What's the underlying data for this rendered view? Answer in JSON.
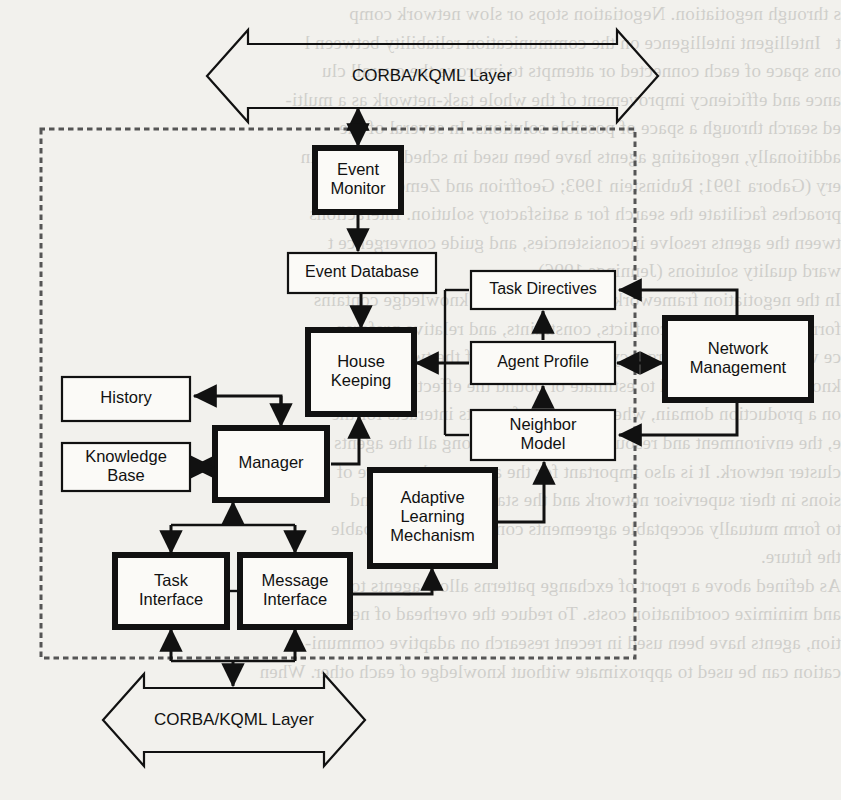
{
  "figure": {
    "background_color": "#f2f1ed",
    "line_color": "#111111",
    "box_fill": "#fbfaf7",
    "boundary_style": "dotted"
  },
  "layers": {
    "top": {
      "label": "CORBA/KQML Layer",
      "name": "top-corba-kqml-layer"
    },
    "bottom": {
      "label": "CORBA/KQML Layer",
      "name": "bottom-corba-kqml-layer"
    }
  },
  "nodes": [
    {
      "id": "event-monitor",
      "label_lines": [
        "Event",
        "Monitor"
      ],
      "emphasis": "thick",
      "x": 315,
      "y": 148,
      "w": 86,
      "h": 64
    },
    {
      "id": "event-database",
      "label_lines": [
        "Event Database"
      ],
      "emphasis": "thin",
      "x": 288,
      "y": 253,
      "w": 148,
      "h": 40
    },
    {
      "id": "house-keeping",
      "label_lines": [
        "House",
        "Keeping"
      ],
      "emphasis": "thick",
      "x": 308,
      "y": 330,
      "w": 106,
      "h": 84
    },
    {
      "id": "history",
      "label_lines": [
        "History"
      ],
      "emphasis": "thin",
      "x": 62,
      "y": 377,
      "w": 128,
      "h": 44
    },
    {
      "id": "knowledge-base",
      "label_lines": [
        "Knowledge",
        "Base"
      ],
      "emphasis": "thin",
      "x": 62,
      "y": 443,
      "w": 128,
      "h": 48
    },
    {
      "id": "manager",
      "label_lines": [
        "Manager"
      ],
      "emphasis": "thick",
      "x": 215,
      "y": 428,
      "w": 112,
      "h": 72
    },
    {
      "id": "task-interface",
      "label_lines": [
        "Task",
        "Interface"
      ],
      "emphasis": "thick",
      "x": 115,
      "y": 555,
      "w": 112,
      "h": 72
    },
    {
      "id": "message-interface",
      "label_lines": [
        "Message",
        "Interface"
      ],
      "emphasis": "thick",
      "x": 240,
      "y": 555,
      "w": 110,
      "h": 72
    },
    {
      "id": "adaptive-learning",
      "label_lines": [
        "Adaptive",
        "Learning",
        "Mechanism"
      ],
      "emphasis": "thick",
      "x": 370,
      "y": 470,
      "w": 125,
      "h": 96
    },
    {
      "id": "task-directives",
      "label_lines": [
        "Task Directives"
      ],
      "emphasis": "thin",
      "x": 471,
      "y": 271,
      "w": 144,
      "h": 38
    },
    {
      "id": "agent-profile",
      "label_lines": [
        "Agent Profile"
      ],
      "emphasis": "thin",
      "x": 471,
      "y": 342,
      "w": 144,
      "h": 42
    },
    {
      "id": "neighbor-model",
      "label_lines": [
        "Neighbor",
        "Model"
      ],
      "emphasis": "thin",
      "x": 471,
      "y": 410,
      "w": 144,
      "h": 50
    },
    {
      "id": "network-management",
      "label_lines": [
        "Network",
        "Management"
      ],
      "emphasis": "thick",
      "x": 665,
      "y": 318,
      "w": 146,
      "h": 82
    }
  ],
  "connections": [
    {
      "from": "top-corba-kqml-layer",
      "to": "event-monitor",
      "type": "bidirectional"
    },
    {
      "from": "event-monitor",
      "to": "event-database",
      "type": "directed"
    },
    {
      "from": "event-database",
      "to": "house-keeping",
      "type": "directed"
    },
    {
      "from": "house-keeping",
      "to": "history",
      "type": "directed"
    },
    {
      "from": "house-keeping",
      "to": "manager",
      "type": "directed"
    },
    {
      "from": "manager",
      "to": "house-keeping",
      "type": "directed"
    },
    {
      "from": "knowledge-base",
      "to": "manager",
      "type": "bidirectional"
    },
    {
      "from": "manager",
      "to": "task-interface",
      "type": "directed"
    },
    {
      "from": "manager",
      "to": "message-interface",
      "type": "directed"
    },
    {
      "from": "task-interface",
      "to": "manager",
      "type": "directed"
    },
    {
      "from": "message-interface",
      "to": "manager",
      "type": "directed"
    },
    {
      "from": "task-interface",
      "to": "message-interface",
      "type": "link"
    },
    {
      "from": "message-interface",
      "to": "adaptive-learning",
      "type": "directed"
    },
    {
      "from": "adaptive-learning",
      "to": "neighbor-model",
      "type": "directed"
    },
    {
      "from": "bottom-corba-kqml-layer",
      "to": "task-interface",
      "type": "directed"
    },
    {
      "from": "bottom-corba-kqml-layer",
      "to": "message-interface",
      "type": "directed"
    },
    {
      "from": "message-interface",
      "to": "bottom-corba-kqml-layer",
      "type": "directed"
    },
    {
      "from": "task-directives",
      "to": "house-keeping",
      "type": "directed"
    },
    {
      "from": "agent-profile",
      "to": "house-keeping",
      "type": "directed"
    },
    {
      "from": "neighbor-model",
      "to": "agent-profile",
      "type": "directed"
    },
    {
      "from": "agent-profile",
      "to": "task-directives",
      "type": "directed"
    },
    {
      "from": "agent-profile",
      "to": "network-management",
      "type": "bidirectional"
    },
    {
      "from": "network-management",
      "to": "task-directives",
      "type": "directed"
    },
    {
      "from": "network-management",
      "to": "neighbor-model",
      "type": "directed"
    }
  ],
  "ghost_text": {
    "note": "faint mirrored show-through text from the reverse side of the printed page",
    "lines": [
      "s through negotiation. Negotiation stops or slow network comp",
      "t   Intelligent intelligence on the communication reliability between l",
      "ons space of each connected or attempts to improve the overall clu",
      "ance and efficiency improvement of the whole task-network as a multi-",
      "ed search through a space of possible solutions. In several of the",
      "additionally, negotiating agents have been used in scheduling domain",
      "ery (Gabora 1991; Rubinstein 1993; Geoffrion and Zemer 1991",
      "proaches facilitate the search for a satisfactory solution. Interactions",
      "tween the agents resolve inconsistencies, and guide convergence t",
      "ward quality solutions (Jennings 1996).",
      "In the negotiation frameworks the coordinating knowledge contains",
      "formation about prior conflicts, constraints, and relative preferen",
      "ce with the degree of urgency of tasks. In one of the two framework",
      "knowledge can be used to estimate or bound the effects of resource",
      "on a production domain, where a group of agents interacts for the",
      "e, the environment and resources are shared among all the agents",
      "cluster network. It is also important for the agents to be aware of",
      "sions in their supervisor network and the state of resources and",
      "to form mutually acceptable agreements considering the probable",
      "the future.",
      "As defined above a report of exchange patterns allow agents to reduce",
      "and minimize coordination costs. To reduce the overhead of negotia-",
      "tion, agents have been used in recent research on adaptive communi-",
      "cation can be used to approximate without knowledge of each other. When"
    ]
  }
}
